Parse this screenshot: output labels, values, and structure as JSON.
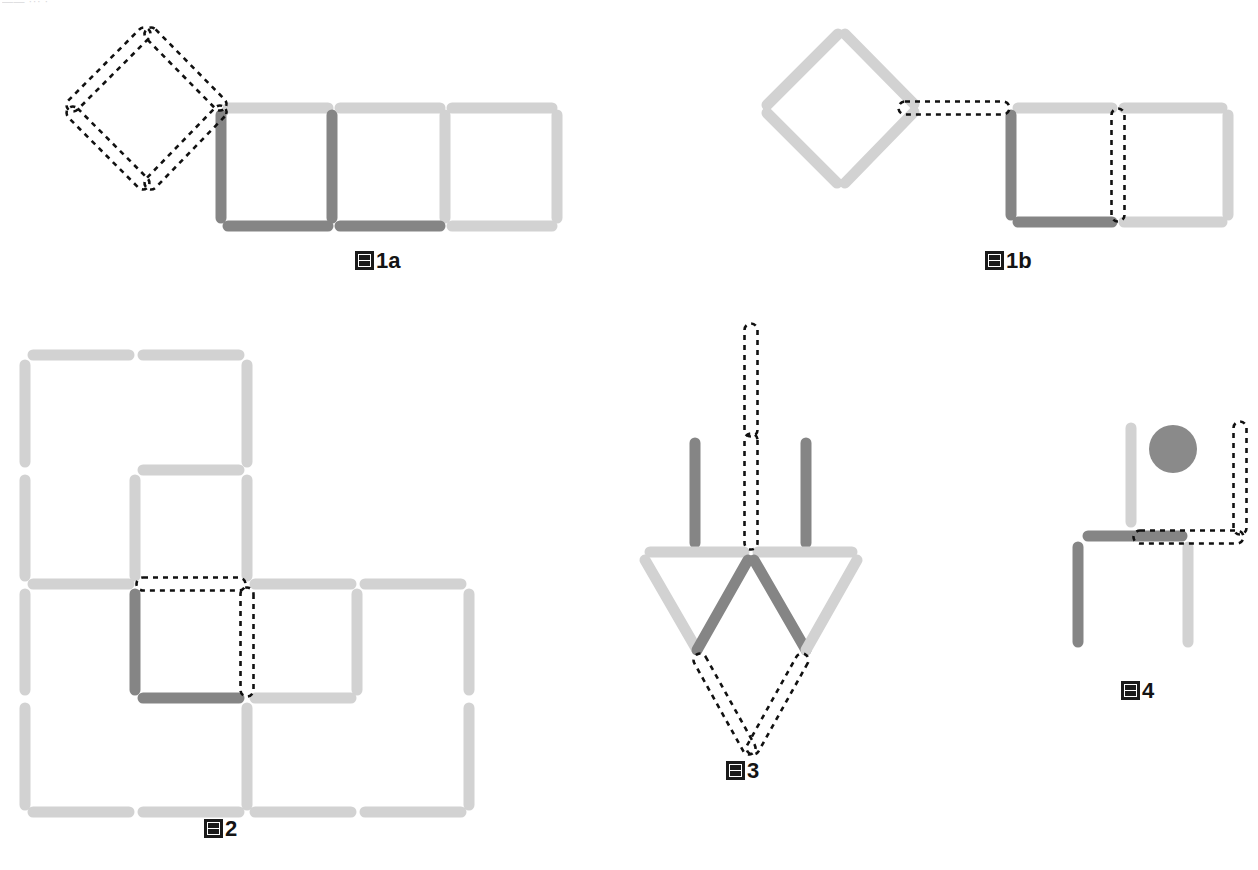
{
  "page": {
    "width": 1258,
    "height": 870,
    "background": "#ffffff",
    "top_fragment_text": "—— ··· ·"
  },
  "colors": {
    "stick_light": "#d2d2d2",
    "stick_dark": "#858585",
    "ghost_outline": "#111111",
    "ball": "#8a8a8a",
    "caption_text": "#141414"
  },
  "captions": [
    {
      "id": "fig1a",
      "tofu": "圖",
      "number": "1a",
      "x": 355,
      "y": 250
    },
    {
      "id": "fig1b",
      "tofu": "圖",
      "number": "1b",
      "x": 985,
      "y": 250
    },
    {
      "id": "fig2",
      "tofu": "圖",
      "number": "2",
      "x": 204,
      "y": 818
    },
    {
      "id": "fig3",
      "tofu": "圖",
      "number": "3",
      "x": 726,
      "y": 760
    },
    {
      "id": "fig4",
      "tofu": "圖",
      "number": "4",
      "x": 1121,
      "y": 680
    }
  ],
  "figures": {
    "fig1a": {
      "name": "figure-1a",
      "description": "Three squares in a row with a dashed diamond ghost attached at upper-left",
      "sticks": [
        {
          "name": "sq1-top",
          "x1": 228,
          "y1": 108,
          "x2": 328,
          "y2": 108,
          "color": "light"
        },
        {
          "name": "sq1-left",
          "x1": 221,
          "y1": 115,
          "x2": 221,
          "y2": 218,
          "color": "dark"
        },
        {
          "name": "sq1-right",
          "x1": 332,
          "y1": 115,
          "x2": 332,
          "y2": 218,
          "color": "dark"
        },
        {
          "name": "sq1-bottom",
          "x1": 228,
          "y1": 226,
          "x2": 328,
          "y2": 226,
          "color": "dark"
        },
        {
          "name": "sq2-top",
          "x1": 340,
          "y1": 108,
          "x2": 440,
          "y2": 108,
          "color": "light"
        },
        {
          "name": "sq2-right",
          "x1": 445,
          "y1": 115,
          "x2": 445,
          "y2": 218,
          "color": "light"
        },
        {
          "name": "sq2-bottom",
          "x1": 340,
          "y1": 226,
          "x2": 440,
          "y2": 226,
          "color": "dark"
        },
        {
          "name": "sq3-top",
          "x1": 452,
          "y1": 108,
          "x2": 552,
          "y2": 108,
          "color": "light"
        },
        {
          "name": "sq3-right",
          "x1": 557,
          "y1": 115,
          "x2": 557,
          "y2": 218,
          "color": "light"
        },
        {
          "name": "sq3-bottom",
          "x1": 452,
          "y1": 226,
          "x2": 552,
          "y2": 226,
          "color": "light"
        }
      ],
      "ghosts": [
        {
          "name": "ghost-diamond-upper-left",
          "x1": 144,
          "y1": 34,
          "x2": 73,
          "y2": 105
        },
        {
          "name": "ghost-diamond-upper-right",
          "x1": 151,
          "y1": 34,
          "x2": 220,
          "y2": 104
        },
        {
          "name": "ghost-diamond-lower-left",
          "x1": 73,
          "y1": 113,
          "x2": 143,
          "y2": 183
        },
        {
          "name": "ghost-diamond-lower-right",
          "x1": 220,
          "y1": 112,
          "x2": 151,
          "y2": 183
        }
      ]
    },
    "fig1b": {
      "name": "figure-1b",
      "description": "Solid diamond on the left, dashed horizontal link, then two squares with a dashed vertical divider",
      "sticks": [
        {
          "name": "diamond-upper-left",
          "x1": 838,
          "y1": 34,
          "x2": 767,
          "y2": 105,
          "color": "light"
        },
        {
          "name": "diamond-upper-right",
          "x1": 845,
          "y1": 34,
          "x2": 914,
          "y2": 104,
          "color": "light"
        },
        {
          "name": "diamond-lower-left",
          "x1": 767,
          "y1": 113,
          "x2": 837,
          "y2": 183,
          "color": "light"
        },
        {
          "name": "diamond-lower-right",
          "x1": 914,
          "y1": 112,
          "x2": 845,
          "y2": 183,
          "color": "light"
        },
        {
          "name": "sqA-top",
          "x1": 1018,
          "y1": 108,
          "x2": 1112,
          "y2": 108,
          "color": "light"
        },
        {
          "name": "sqA-left",
          "x1": 1011,
          "y1": 115,
          "x2": 1011,
          "y2": 215,
          "color": "dark"
        },
        {
          "name": "sqA-bottom",
          "x1": 1018,
          "y1": 222,
          "x2": 1112,
          "y2": 222,
          "color": "dark"
        },
        {
          "name": "sqB-top",
          "x1": 1124,
          "y1": 108,
          "x2": 1222,
          "y2": 108,
          "color": "light"
        },
        {
          "name": "sqB-right",
          "x1": 1228,
          "y1": 115,
          "x2": 1228,
          "y2": 215,
          "color": "light"
        },
        {
          "name": "sqB-bottom",
          "x1": 1124,
          "y1": 222,
          "x2": 1222,
          "y2": 222,
          "color": "light"
        }
      ],
      "ghosts": [
        {
          "name": "ghost-link-horizontal",
          "x1": 905,
          "y1": 108,
          "x2": 1003,
          "y2": 108
        },
        {
          "name": "ghost-divider-vertical",
          "x1": 1118,
          "y1": 115,
          "x2": 1118,
          "y2": 215
        }
      ]
    },
    "fig2": {
      "name": "figure-2",
      "description": "Stair-shaped grid of squares with one dark square corner and an L-shaped dashed ghost pair",
      "sticks": [
        {
          "name": "r1-top-1",
          "x1": 33,
          "y1": 355,
          "x2": 129,
          "y2": 355,
          "color": "light"
        },
        {
          "name": "r1-top-2",
          "x1": 143,
          "y1": 355,
          "x2": 239,
          "y2": 355,
          "color": "light"
        },
        {
          "name": "r1-left",
          "x1": 25,
          "y1": 365,
          "x2": 25,
          "y2": 462,
          "color": "light"
        },
        {
          "name": "r1-right",
          "x1": 247,
          "y1": 365,
          "x2": 247,
          "y2": 462,
          "color": "light"
        },
        {
          "name": "r2-top-3",
          "x1": 143,
          "y1": 470,
          "x2": 239,
          "y2": 470,
          "color": "light"
        },
        {
          "name": "r2-left",
          "x1": 25,
          "y1": 480,
          "x2": 25,
          "y2": 576,
          "color": "light"
        },
        {
          "name": "r2-mid",
          "x1": 135,
          "y1": 480,
          "x2": 135,
          "y2": 576,
          "color": "light"
        },
        {
          "name": "r2-right",
          "x1": 247,
          "y1": 480,
          "x2": 247,
          "y2": 576,
          "color": "light"
        },
        {
          "name": "r3-top-1",
          "x1": 33,
          "y1": 584,
          "x2": 129,
          "y2": 584,
          "color": "light"
        },
        {
          "name": "r3-top-3",
          "x1": 255,
          "y1": 584,
          "x2": 351,
          "y2": 584,
          "color": "light"
        },
        {
          "name": "r3-top-4",
          "x1": 365,
          "y1": 584,
          "x2": 461,
          "y2": 584,
          "color": "light"
        },
        {
          "name": "r3-left",
          "x1": 25,
          "y1": 594,
          "x2": 25,
          "y2": 690,
          "color": "light"
        },
        {
          "name": "r3-dark-v",
          "x1": 135,
          "y1": 594,
          "x2": 135,
          "y2": 690,
          "color": "dark"
        },
        {
          "name": "r3-right",
          "x1": 357,
          "y1": 594,
          "x2": 357,
          "y2": 690,
          "color": "light"
        },
        {
          "name": "r3-far-right",
          "x1": 469,
          "y1": 594,
          "x2": 469,
          "y2": 690,
          "color": "light"
        },
        {
          "name": "r4-top-dark",
          "x1": 143,
          "y1": 698,
          "x2": 239,
          "y2": 698,
          "color": "dark"
        },
        {
          "name": "r4-top-3",
          "x1": 255,
          "y1": 698,
          "x2": 351,
          "y2": 698,
          "color": "light"
        },
        {
          "name": "r4-left",
          "x1": 25,
          "y1": 708,
          "x2": 25,
          "y2": 805,
          "color": "light"
        },
        {
          "name": "r4-mid",
          "x1": 247,
          "y1": 708,
          "x2": 247,
          "y2": 805,
          "color": "light"
        },
        {
          "name": "r4-right",
          "x1": 469,
          "y1": 708,
          "x2": 469,
          "y2": 805,
          "color": "light"
        },
        {
          "name": "r5-bot-1",
          "x1": 33,
          "y1": 812,
          "x2": 129,
          "y2": 812,
          "color": "light"
        },
        {
          "name": "r5-bot-2",
          "x1": 143,
          "y1": 812,
          "x2": 239,
          "y2": 812,
          "color": "light"
        },
        {
          "name": "r5-bot-3",
          "x1": 255,
          "y1": 812,
          "x2": 351,
          "y2": 812,
          "color": "light"
        },
        {
          "name": "r5-bot-4",
          "x1": 365,
          "y1": 812,
          "x2": 461,
          "y2": 812,
          "color": "light"
        }
      ],
      "ghosts": [
        {
          "name": "ghost-horizontal-top",
          "x1": 143,
          "y1": 584,
          "x2": 239,
          "y2": 584
        },
        {
          "name": "ghost-vertical-right",
          "x1": 247,
          "y1": 594,
          "x2": 247,
          "y2": 690
        }
      ]
    },
    "fig3": {
      "name": "figure-3",
      "description": "Two inverted triangles forming an arrow, with dark uprights, a long dashed shaft above and a dashed V below",
      "sticks": [
        {
          "name": "upright-left",
          "x1": 695,
          "y1": 443,
          "x2": 695,
          "y2": 543,
          "color": "dark"
        },
        {
          "name": "upright-right",
          "x1": 806,
          "y1": 443,
          "x2": 806,
          "y2": 543,
          "color": "dark"
        },
        {
          "name": "bar-left",
          "x1": 650,
          "y1": 552,
          "x2": 744,
          "y2": 552,
          "color": "light"
        },
        {
          "name": "bar-right",
          "x1": 758,
          "y1": 552,
          "x2": 852,
          "y2": 552,
          "color": "light"
        },
        {
          "name": "tri1-outer",
          "x1": 645,
          "y1": 560,
          "x2": 697,
          "y2": 650,
          "color": "light"
        },
        {
          "name": "tri1-inner",
          "x1": 748,
          "y1": 560,
          "x2": 697,
          "y2": 650,
          "color": "dark"
        },
        {
          "name": "tri2-inner",
          "x1": 754,
          "y1": 560,
          "x2": 806,
          "y2": 650,
          "color": "dark"
        },
        {
          "name": "tri2-outer",
          "x1": 857,
          "y1": 560,
          "x2": 806,
          "y2": 650,
          "color": "light"
        }
      ],
      "ghosts": [
        {
          "name": "ghost-shaft-upper",
          "x1": 751,
          "y1": 330,
          "x2": 751,
          "y2": 430
        },
        {
          "name": "ghost-shaft-lower",
          "x1": 751,
          "y1": 440,
          "x2": 751,
          "y2": 543
        },
        {
          "name": "ghost-v-left",
          "x1": 700,
          "y1": 660,
          "x2": 749,
          "y2": 748
        },
        {
          "name": "ghost-v-right",
          "x1": 802,
          "y1": 660,
          "x2": 753,
          "y2": 748
        }
      ]
    },
    "fig4": {
      "name": "figure-4",
      "description": "A chair-like figure of four sticks with a gray ball and a dashed L ghost at the right",
      "sticks": [
        {
          "name": "back-upright",
          "x1": 1131,
          "y1": 428,
          "x2": 1131,
          "y2": 522,
          "color": "light"
        },
        {
          "name": "seat-horizontal",
          "x1": 1088,
          "y1": 536,
          "x2": 1182,
          "y2": 536,
          "color": "dark"
        },
        {
          "name": "leg-left",
          "x1": 1078,
          "y1": 547,
          "x2": 1078,
          "y2": 642,
          "color": "dark"
        },
        {
          "name": "leg-right",
          "x1": 1188,
          "y1": 547,
          "x2": 1188,
          "y2": 642,
          "color": "light"
        }
      ],
      "ghosts": [
        {
          "name": "ghost-upright-right",
          "x1": 1240,
          "y1": 428,
          "x2": 1240,
          "y2": 528
        },
        {
          "name": "ghost-seat-extension",
          "x1": 1140,
          "y1": 537,
          "x2": 1237,
          "y2": 537
        }
      ],
      "ball": {
        "name": "gray-ball",
        "cx": 1173,
        "cy": 449,
        "r": 24,
        "color": "#8a8a8a"
      }
    }
  }
}
